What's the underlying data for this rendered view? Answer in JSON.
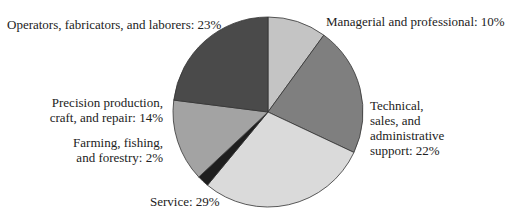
{
  "chart_data": {
    "type": "pie",
    "title": "",
    "start_angle_deg": 0,
    "direction": "clockwise",
    "slices": [
      {
        "label": "Managerial and professional",
        "value": 10,
        "color": "#c4c4c4"
      },
      {
        "label": "Technical, sales, and administrative support",
        "value": 22,
        "color": "#7f7f7f"
      },
      {
        "label": "Service",
        "value": 29,
        "color": "#dadada"
      },
      {
        "label": "Farming, fishing, and forestry",
        "value": 2,
        "color": "#1e1e1e"
      },
      {
        "label": "Precision production, craft, and repair",
        "value": 14,
        "color": "#a3a3a3"
      },
      {
        "label": "Operators, fabricators, and laborers",
        "value": 23,
        "color": "#4a4a4a"
      }
    ],
    "units": "%"
  },
  "labels": {
    "managerial": "Managerial and professional: 10%",
    "technical_1": "Technical,",
    "technical_2": "sales, and",
    "technical_3": "administrative",
    "technical_4": "support: 22%",
    "service": "Service: 29%",
    "farming_1": "Farming, fishing,",
    "farming_2": "and forestry: 2%",
    "precision_1": "Precision production,",
    "precision_2": "craft, and repair: 14%",
    "operators": "Operators, fabricators, and laborers: 23%"
  }
}
